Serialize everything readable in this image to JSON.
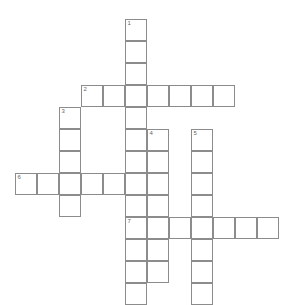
{
  "puzzle": {
    "kind": "crossword-grid",
    "title": "",
    "cell_size": 22,
    "origin_x": 15,
    "origin_y": 19,
    "grid_cols": 12,
    "grid_rows": 12,
    "colors": {
      "cell_fill": "#ffffff",
      "cell_border": "#8c8c8c",
      "number_text": "#666666",
      "background": "#ffffff",
      "letter_text": "#111111"
    },
    "entries": [
      {
        "number": "1",
        "direction": "down",
        "start_col": 5,
        "start_row": 0,
        "length": 12
      },
      {
        "number": "2",
        "direction": "across",
        "start_col": 3,
        "start_row": 3,
        "length": 6
      },
      {
        "number": "3",
        "direction": "down",
        "start_col": 2,
        "start_row": 4,
        "length": 5
      },
      {
        "number": "4",
        "direction": "down",
        "start_col": 6,
        "start_row": 5,
        "length": 6
      },
      {
        "number": "5",
        "direction": "down",
        "start_col": 8,
        "start_row": 5,
        "length": 7
      },
      {
        "number": "6",
        "direction": "across",
        "start_col": 0,
        "start_row": 6,
        "length": 6
      },
      {
        "number": "7",
        "direction": "across",
        "start_col": 5,
        "start_row": 8,
        "length": 7
      }
    ],
    "cells": [
      {
        "col": 5,
        "row": 0,
        "number": "1",
        "letter": ""
      },
      {
        "col": 5,
        "row": 1,
        "number": "",
        "letter": ""
      },
      {
        "col": 5,
        "row": 2,
        "number": "",
        "letter": ""
      },
      {
        "col": 3,
        "row": 3,
        "number": "2",
        "letter": ""
      },
      {
        "col": 4,
        "row": 3,
        "number": "",
        "letter": ""
      },
      {
        "col": 5,
        "row": 3,
        "number": "",
        "letter": ""
      },
      {
        "col": 6,
        "row": 3,
        "number": "",
        "letter": ""
      },
      {
        "col": 7,
        "row": 3,
        "number": "",
        "letter": ""
      },
      {
        "col": 8,
        "row": 3,
        "number": "",
        "letter": ""
      },
      {
        "col": 9,
        "row": 3,
        "number": "",
        "letter": ""
      },
      {
        "col": 2,
        "row": 4,
        "number": "3",
        "letter": ""
      },
      {
        "col": 5,
        "row": 4,
        "number": "",
        "letter": ""
      },
      {
        "col": 2,
        "row": 5,
        "number": "",
        "letter": ""
      },
      {
        "col": 5,
        "row": 5,
        "number": "",
        "letter": ""
      },
      {
        "col": 6,
        "row": 5,
        "number": "4",
        "letter": ""
      },
      {
        "col": 8,
        "row": 5,
        "number": "5",
        "letter": ""
      },
      {
        "col": 2,
        "row": 6,
        "number": "",
        "letter": ""
      },
      {
        "col": 5,
        "row": 6,
        "number": "",
        "letter": ""
      },
      {
        "col": 6,
        "row": 6,
        "number": "",
        "letter": ""
      },
      {
        "col": 8,
        "row": 6,
        "number": "",
        "letter": ""
      },
      {
        "col": 0,
        "row": 7,
        "number": "6",
        "letter": ""
      },
      {
        "col": 1,
        "row": 7,
        "number": "",
        "letter": ""
      },
      {
        "col": 2,
        "row": 7,
        "number": "",
        "letter": ""
      },
      {
        "col": 3,
        "row": 7,
        "number": "",
        "letter": ""
      },
      {
        "col": 4,
        "row": 7,
        "number": "",
        "letter": ""
      },
      {
        "col": 5,
        "row": 7,
        "number": "",
        "letter": ""
      },
      {
        "col": 6,
        "row": 7,
        "number": "",
        "letter": ""
      },
      {
        "col": 8,
        "row": 7,
        "number": "",
        "letter": ""
      },
      {
        "col": 2,
        "row": 8,
        "number": "",
        "letter": ""
      },
      {
        "col": 5,
        "row": 8,
        "number": "",
        "letter": ""
      },
      {
        "col": 6,
        "row": 8,
        "number": "",
        "letter": ""
      },
      {
        "col": 8,
        "row": 8,
        "number": "",
        "letter": ""
      },
      {
        "col": 5,
        "row": 9,
        "number": "7",
        "letter": ""
      },
      {
        "col": 6,
        "row": 9,
        "number": "",
        "letter": ""
      },
      {
        "col": 7,
        "row": 9,
        "number": "",
        "letter": ""
      },
      {
        "col": 8,
        "row": 9,
        "number": "",
        "letter": ""
      },
      {
        "col": 9,
        "row": 9,
        "number": "",
        "letter": ""
      },
      {
        "col": 10,
        "row": 9,
        "number": "",
        "letter": ""
      },
      {
        "col": 11,
        "row": 9,
        "number": "",
        "letter": ""
      },
      {
        "col": 5,
        "row": 10,
        "number": "",
        "letter": ""
      },
      {
        "col": 6,
        "row": 10,
        "number": "",
        "letter": ""
      },
      {
        "col": 8,
        "row": 10,
        "number": "",
        "letter": ""
      },
      {
        "col": 5,
        "row": 11,
        "number": "",
        "letter": ""
      },
      {
        "col": 6,
        "row": 11,
        "number": "",
        "letter": ""
      },
      {
        "col": 8,
        "row": 11,
        "number": "",
        "letter": ""
      },
      {
        "col": 5,
        "row": 12,
        "number": "",
        "letter": ""
      },
      {
        "col": 8,
        "row": 12,
        "number": "",
        "letter": ""
      }
    ]
  }
}
